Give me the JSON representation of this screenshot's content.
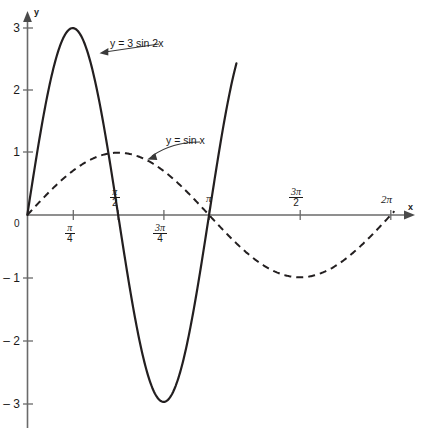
{
  "chart_data": {
    "type": "line",
    "title": "",
    "xlabel": "x",
    "ylabel": "y",
    "xlim": [
      0,
      6.283185307179586
    ],
    "ylim": [
      -3.4,
      3.4
    ],
    "grid": false,
    "legend": "inline-annotations",
    "x_ticks": [
      {
        "value": 0,
        "label": "0",
        "style": "plain"
      },
      {
        "value": 0.7853981634,
        "numerator": "π",
        "denominator": "4",
        "style": "fraction"
      },
      {
        "value": 1.5707963268,
        "numerator": "π",
        "denominator": "2",
        "style": "fraction"
      },
      {
        "value": 2.3561944902,
        "numerator": "3π",
        "denominator": "4",
        "style": "fraction"
      },
      {
        "value": 3.1415926536,
        "label": "π",
        "style": "plain"
      },
      {
        "value": 4.7123889804,
        "numerator": "3π",
        "denominator": "2",
        "style": "fraction"
      },
      {
        "value": 6.2831853072,
        "label": "2π",
        "style": "plain"
      }
    ],
    "y_ticks": [
      {
        "value": 3,
        "label": "3"
      },
      {
        "value": 2,
        "label": "2"
      },
      {
        "value": 1,
        "label": "1"
      },
      {
        "value": -1,
        "label": "– 1"
      },
      {
        "value": -2,
        "label": "– 2"
      },
      {
        "value": -3,
        "label": "– 3"
      }
    ],
    "series": [
      {
        "name": "y = 3 sin 2x",
        "label": "y = 3 sin 2x",
        "style": "solid",
        "amplitude": 3,
        "frequency": 2,
        "color": "#231f20",
        "key_points": [
          {
            "x": 0,
            "y": 0
          },
          {
            "x": 0.7853981634,
            "y": 3
          },
          {
            "x": 1.5707963268,
            "y": 0
          },
          {
            "x": 2.3561944902,
            "y": -3
          },
          {
            "x": 3.1415926536,
            "y": 0
          }
        ]
      },
      {
        "name": "y = sin x",
        "label": "y = sin x",
        "style": "dashed",
        "amplitude": 1,
        "frequency": 1,
        "color": "#231f20",
        "key_points": [
          {
            "x": 0,
            "y": 0
          },
          {
            "x": 1.5707963268,
            "y": 1
          },
          {
            "x": 3.1415926536,
            "y": 0
          },
          {
            "x": 4.7123889804,
            "y": -1
          },
          {
            "x": 6.2831853072,
            "y": 0
          }
        ]
      }
    ],
    "annotations": [
      {
        "text": "y = 3 sin 2x",
        "target_x": 1.05,
        "target_y": 2.62
      },
      {
        "text": "y = sin x",
        "target_x": 2.05,
        "target_y": 0.92
      }
    ]
  },
  "axes": {
    "x_axis_name": "x",
    "y_axis_name": "y",
    "origin_label": "0"
  }
}
